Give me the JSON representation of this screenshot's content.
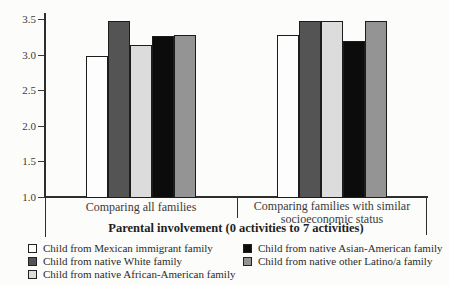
{
  "chart_data": {
    "type": "bar",
    "title": "",
    "xlabel": "Parental involvement (0 activities to 7 activities)",
    "ylabel": "",
    "ylim": [
      1.0,
      3.5
    ],
    "yticks": [
      1.0,
      1.5,
      2.0,
      2.5,
      3.0,
      3.5
    ],
    "grid": false,
    "legend_position": "bottom",
    "categories": [
      "Comparing all families",
      "Comparing families with similar socioeconomic status"
    ],
    "series": [
      {
        "name": "Child from Mexican immigrant family",
        "color": "#fdfdfd",
        "values": [
          2.98,
          3.27
        ]
      },
      {
        "name": "Child from native White family",
        "color": "#545454",
        "values": [
          3.47,
          3.47
        ]
      },
      {
        "name": "Child from native African-American family",
        "color": "#dcdcdc",
        "values": [
          3.13,
          3.47
        ]
      },
      {
        "name": "Child from native Asian-American family",
        "color": "#0c0c0c",
        "values": [
          3.26,
          3.19
        ]
      },
      {
        "name": "Child from native other Latino/a family",
        "color": "#949494",
        "values": [
          3.28,
          3.47
        ]
      }
    ],
    "colors": {
      "axis": "#2e2e2e",
      "bar_outline": "#1c1c1c",
      "text": "#3a3a3a"
    }
  }
}
